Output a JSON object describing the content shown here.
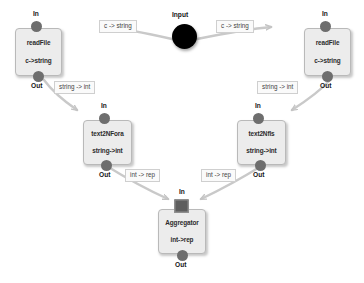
{
  "graph": {
    "title": "dataflow-pipeline",
    "colors": {
      "node_fill": "#ececec",
      "node_border": "#b9b9b9",
      "port_fill": "#6e6e6e",
      "input_fill": "#000000",
      "wire": "#c9c9c9",
      "label_bg": "#fafafa",
      "label_border": "#cfcfcf",
      "canvas": "#ffffff"
    },
    "port_names": {
      "in": "In",
      "out": "Out"
    },
    "input": {
      "label": "Input",
      "shape": "circle"
    },
    "nodes": [
      {
        "id": "readfile-left",
        "name": "readFile",
        "type": "c->string",
        "in": "In",
        "out": "Out",
        "in_shape": "circle"
      },
      {
        "id": "readfile-right",
        "name": "readFile",
        "type": "c->string",
        "in": "In",
        "out": "Out",
        "in_shape": "circle"
      },
      {
        "id": "text2nfora",
        "name": "text2NFora",
        "type": "string->int",
        "in": "In",
        "out": "Out",
        "in_shape": "circle"
      },
      {
        "id": "text2nfls",
        "name": "text2Nfls",
        "type": "string->int",
        "in": "In",
        "out": "Out",
        "in_shape": "circle"
      },
      {
        "id": "aggregator",
        "name": "Aggregator",
        "type": "int->rep",
        "in": "In",
        "out": "Out",
        "in_shape": "square"
      }
    ],
    "edges": [
      {
        "id": "e1",
        "from": "input",
        "to": "readfile-left",
        "label": "c -> string"
      },
      {
        "id": "e2",
        "from": "input",
        "to": "readfile-right",
        "label": "c -> string"
      },
      {
        "id": "e3",
        "from": "readfile-left",
        "to": "text2nfora",
        "label": "string -> int"
      },
      {
        "id": "e4",
        "from": "readfile-right",
        "to": "text2nfls",
        "label": "string -> int"
      },
      {
        "id": "e5",
        "from": "text2nfora",
        "to": "aggregator",
        "label": "int -> rep"
      },
      {
        "id": "e6",
        "from": "text2nfls",
        "to": "aggregator",
        "label": "int -> rep"
      }
    ]
  }
}
